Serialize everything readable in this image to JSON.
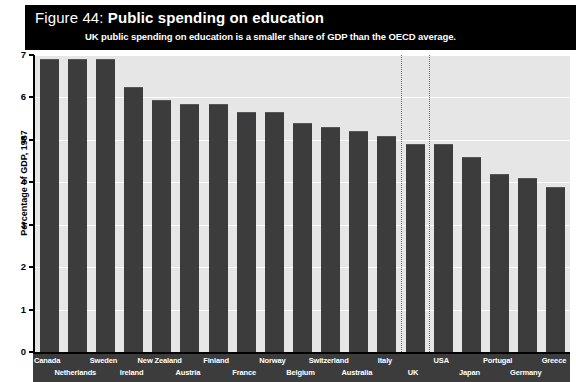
{
  "header": {
    "figure_label": "Figure 44:",
    "title": "Public spending on education",
    "subtitle": "UK public spending on education is a smaller share of GDP than the OECD average."
  },
  "axis": {
    "ylabel": "Percentage of GDP, 1987",
    "yticks": [
      "0",
      "1",
      "2",
      "3",
      "4",
      "5",
      "6",
      "7"
    ]
  },
  "colors": {
    "header_background": "#000000",
    "header_text": "#ffffff",
    "plot_background": "#e6e6e6",
    "bar": "#3c3c3c",
    "gridline": "#ffffff",
    "label_band": "#3c3c3c",
    "marker_line": "#6a6a6a"
  },
  "chart_data": {
    "type": "bar",
    "title": "Public spending on education",
    "subtitle": "UK public spending on education is a smaller share of GDP than the OECD average.",
    "xlabel": "",
    "ylabel": "Percentage of GDP, 1987",
    "ylim": [
      0,
      7
    ],
    "yticks": [
      0,
      1,
      2,
      3,
      4,
      5,
      6,
      7
    ],
    "grid": true,
    "legend": "none",
    "categories": [
      "Canada",
      "Netherlands",
      "Sweden",
      "Ireland",
      "New Zealand",
      "Austria",
      "Finland",
      "France",
      "Norway",
      "Belgium",
      "Switzerland",
      "Australia",
      "Italy",
      "UK",
      "USA",
      "Japan",
      "Portugal",
      "Germany",
      "Greece"
    ],
    "values": [
      6.9,
      6.9,
      6.9,
      6.25,
      5.95,
      5.85,
      5.85,
      5.65,
      5.65,
      5.4,
      5.3,
      5.2,
      5.1,
      4.9,
      4.9,
      4.6,
      4.2,
      4.1,
      3.9
    ],
    "annotations": [
      {
        "type": "vertical-dotted-line",
        "position": "before-UK"
      },
      {
        "type": "vertical-dotted-line",
        "position": "after-UK"
      }
    ]
  }
}
